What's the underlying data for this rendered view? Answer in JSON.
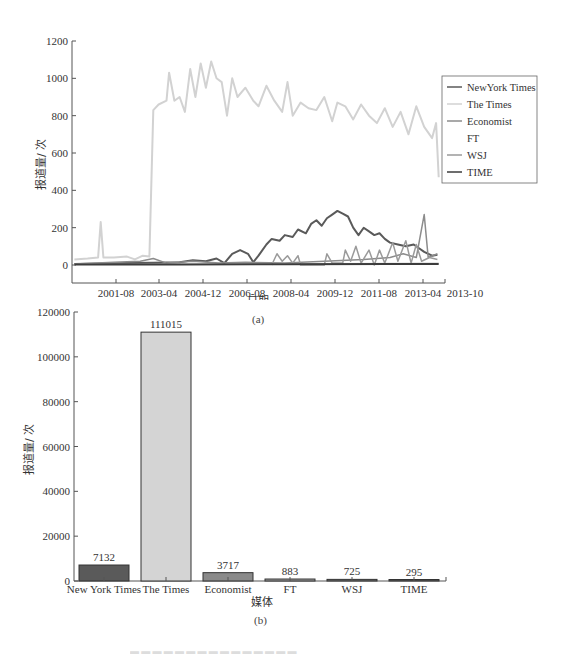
{
  "chart_data": [
    {
      "type": "line",
      "panel_label": "(a)",
      "title": "",
      "xlabel": "日期",
      "ylabel": "报道量/ 次",
      "ylim": [
        -100,
        1200
      ],
      "yticks": [
        0,
        200,
        400,
        600,
        800,
        1000,
        1200
      ],
      "xticks": [
        "2001-08",
        "2003-04",
        "2004-12",
        "2006-08",
        "2008-04",
        "2009-12",
        "2011-08",
        "2013-04",
        "2013-10"
      ],
      "grid": false,
      "legend_position": "right",
      "legend": [
        "NewYork Times",
        "The Times",
        "Economist",
        "FT",
        "WSJ",
        "TIME"
      ],
      "series": [
        {
          "name": "NewYork Times",
          "color": "#5a5a5a",
          "width": 2,
          "points": [
            [
              2000.0,
              5
            ],
            [
              2001.0,
              8
            ],
            [
              2002.0,
              10
            ],
            [
              2003.0,
              12
            ],
            [
              2004.0,
              15
            ],
            [
              2004.5,
              25
            ],
            [
              2005.0,
              20
            ],
            [
              2005.4,
              35
            ],
            [
              2005.7,
              10
            ],
            [
              2006.0,
              60
            ],
            [
              2006.3,
              80
            ],
            [
              2006.6,
              60
            ],
            [
              2006.8,
              15
            ],
            [
              2007.0,
              50
            ],
            [
              2007.3,
              110
            ],
            [
              2007.5,
              140
            ],
            [
              2007.8,
              130
            ],
            [
              2008.0,
              160
            ],
            [
              2008.3,
              150
            ],
            [
              2008.5,
              190
            ],
            [
              2008.8,
              170
            ],
            [
              2009.0,
              220
            ],
            [
              2009.2,
              240
            ],
            [
              2009.4,
              210
            ],
            [
              2009.6,
              250
            ],
            [
              2009.8,
              270
            ],
            [
              2010.0,
              290
            ],
            [
              2010.2,
              275
            ],
            [
              2010.4,
              260
            ],
            [
              2010.6,
              200
            ],
            [
              2010.8,
              160
            ],
            [
              2011.0,
              200
            ],
            [
              2011.2,
              180
            ],
            [
              2011.4,
              160
            ],
            [
              2011.6,
              170
            ],
            [
              2011.8,
              140
            ],
            [
              2012.0,
              120
            ],
            [
              2012.3,
              110
            ],
            [
              2012.6,
              100
            ],
            [
              2012.9,
              110
            ],
            [
              2013.1,
              90
            ],
            [
              2013.3,
              70
            ],
            [
              2013.6,
              50
            ],
            [
              2013.8,
              55
            ]
          ]
        },
        {
          "name": "The Times",
          "color": "#d2d2d2",
          "width": 2,
          "points": [
            [
              2000.0,
              30
            ],
            [
              2000.5,
              35
            ],
            [
              2000.9,
              40
            ],
            [
              2001.0,
              230
            ],
            [
              2001.1,
              40
            ],
            [
              2001.5,
              40
            ],
            [
              2002.0,
              45
            ],
            [
              2002.3,
              30
            ],
            [
              2002.6,
              50
            ],
            [
              2002.85,
              45
            ],
            [
              2003.0,
              830
            ],
            [
              2003.2,
              860
            ],
            [
              2003.5,
              880
            ],
            [
              2003.6,
              1030
            ],
            [
              2003.8,
              880
            ],
            [
              2004.0,
              900
            ],
            [
              2004.2,
              820
            ],
            [
              2004.4,
              1050
            ],
            [
              2004.6,
              900
            ],
            [
              2004.8,
              1080
            ],
            [
              2005.0,
              950
            ],
            [
              2005.2,
              1090
            ],
            [
              2005.4,
              1000
            ],
            [
              2005.6,
              980
            ],
            [
              2005.8,
              800
            ],
            [
              2006.0,
              1000
            ],
            [
              2006.2,
              900
            ],
            [
              2006.5,
              950
            ],
            [
              2006.8,
              880
            ],
            [
              2007.0,
              850
            ],
            [
              2007.3,
              960
            ],
            [
              2007.6,
              880
            ],
            [
              2007.9,
              820
            ],
            [
              2008.1,
              980
            ],
            [
              2008.3,
              800
            ],
            [
              2008.6,
              870
            ],
            [
              2008.9,
              840
            ],
            [
              2009.2,
              830
            ],
            [
              2009.5,
              900
            ],
            [
              2009.8,
              770
            ],
            [
              2010.0,
              870
            ],
            [
              2010.3,
              850
            ],
            [
              2010.6,
              780
            ],
            [
              2010.9,
              860
            ],
            [
              2011.2,
              800
            ],
            [
              2011.5,
              760
            ],
            [
              2011.8,
              840
            ],
            [
              2012.1,
              740
            ],
            [
              2012.4,
              820
            ],
            [
              2012.7,
              700
            ],
            [
              2013.0,
              850
            ],
            [
              2013.3,
              740
            ],
            [
              2013.6,
              680
            ],
            [
              2013.75,
              760
            ],
            [
              2013.85,
              470
            ]
          ]
        },
        {
          "name": "Economist",
          "color": "#8c8c8c",
          "width": 1.5,
          "points": [
            [
              2000.0,
              5
            ],
            [
              2001.5,
              15
            ],
            [
              2002.5,
              20
            ],
            [
              2003.0,
              35
            ],
            [
              2003.5,
              10
            ],
            [
              2004.5,
              20
            ],
            [
              2005.5,
              10
            ],
            [
              2006.5,
              15
            ],
            [
              2008.0,
              10
            ],
            [
              2009.5,
              20
            ],
            [
              2011.0,
              30
            ],
            [
              2012.0,
              40
            ],
            [
              2012.5,
              60
            ],
            [
              2013.0,
              40
            ],
            [
              2013.3,
              270
            ],
            [
              2013.45,
              40
            ],
            [
              2013.8,
              60
            ]
          ]
        },
        {
          "name": "FT",
          "color": "#bdbdbd",
          "width": 1,
          "points": [
            [
              2000.0,
              3
            ],
            [
              2005.0,
              5
            ],
            [
              2010.0,
              8
            ],
            [
              2013.85,
              10
            ]
          ]
        },
        {
          "name": "WSJ",
          "color": "#9a9a9a",
          "width": 1.5,
          "points": [
            [
              2007.5,
              0
            ],
            [
              2007.7,
              60
            ],
            [
              2007.9,
              20
            ],
            [
              2008.1,
              50
            ],
            [
              2008.3,
              10
            ],
            [
              2008.5,
              50
            ],
            [
              2008.6,
              0
            ],
            [
              2009.5,
              0
            ],
            [
              2009.6,
              60
            ],
            [
              2009.8,
              10
            ],
            [
              2010.2,
              10
            ],
            [
              2010.3,
              80
            ],
            [
              2010.5,
              20
            ],
            [
              2010.7,
              100
            ],
            [
              2010.9,
              10
            ],
            [
              2011.2,
              80
            ],
            [
              2011.4,
              0
            ],
            [
              2011.6,
              80
            ],
            [
              2011.8,
              10
            ],
            [
              2012.1,
              120
            ],
            [
              2012.3,
              20
            ],
            [
              2012.6,
              130
            ],
            [
              2012.8,
              10
            ],
            [
              2013.0,
              110
            ],
            [
              2013.2,
              20
            ],
            [
              2013.5,
              40
            ],
            [
              2013.8,
              30
            ]
          ]
        },
        {
          "name": "TIME",
          "color": "#3c3c3c",
          "width": 2,
          "points": [
            [
              2000.0,
              2
            ],
            [
              2004.0,
              3
            ],
            [
              2008.0,
              4
            ],
            [
              2012.0,
              5
            ],
            [
              2013.85,
              6
            ]
          ]
        }
      ]
    },
    {
      "type": "bar",
      "panel_label": "(b)",
      "title": "",
      "xlabel": "媒体",
      "ylabel": "报道量/ 次",
      "ylim": [
        0,
        120000
      ],
      "yticks": [
        0,
        20000,
        40000,
        60000,
        80000,
        100000,
        120000
      ],
      "grid": false,
      "categories": [
        "New York Times",
        "The Times",
        "Economist",
        "FT",
        "WSJ",
        "TIME"
      ],
      "values": [
        7132,
        111015,
        3717,
        883,
        725,
        295
      ],
      "colors": [
        "#5a5a5a",
        "#d4d4d4",
        "#8a8a8a",
        "#a0a0a0",
        "#6a6a6a",
        "#555555"
      ]
    }
  ],
  "captions": {
    "panel_a": "(a)",
    "panel_b": "(b)"
  }
}
